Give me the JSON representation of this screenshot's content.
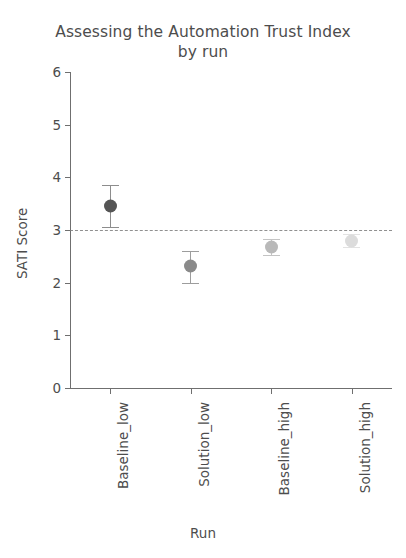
{
  "chart_data": {
    "type": "scatter",
    "title": "Assessing the Automation Trust Index by run",
    "title_line1": "Assessing the Automation Trust Index",
    "title_line2": "by run",
    "xlabel": "Run",
    "ylabel": "SATI Score",
    "ylim": [
      0,
      6
    ],
    "yticks": [
      0,
      1,
      2,
      3,
      4,
      5,
      6
    ],
    "ytick_labels": [
      "0",
      "1",
      "2",
      "3",
      "4",
      "5",
      "6"
    ],
    "grid": false,
    "legend": null,
    "categories": [
      "Baseline_low",
      "Solution_low",
      "Baseline_high",
      "Solution_high"
    ],
    "values": [
      3.45,
      2.31,
      2.67,
      2.8
    ],
    "err_low": [
      3.05,
      2.0,
      2.52,
      2.68
    ],
    "err_high": [
      3.85,
      2.61,
      2.83,
      2.92
    ],
    "point_colors": [
      "#555555",
      "#8a8a8a",
      "#b9b9b9",
      "#dcdcdc"
    ],
    "errorbar_colors": [
      "#8d8d8d",
      "#9d9d9d",
      "#c4c4c4",
      "#e2e2e2"
    ],
    "reference_line": {
      "value": 3,
      "style": "dashdot",
      "color": "#7d7d7d",
      "label": ""
    },
    "points": [
      {
        "category": "Baseline_low",
        "value": 3.45,
        "low": 3.05,
        "high": 3.85,
        "color": "#555555",
        "err_color": "#8d8d8d"
      },
      {
        "category": "Solution_low",
        "value": 2.31,
        "low": 2.0,
        "high": 2.61,
        "color": "#8a8a8a",
        "err_color": "#9d9d9d"
      },
      {
        "category": "Baseline_high",
        "value": 2.67,
        "low": 2.52,
        "high": 2.83,
        "color": "#b9b9b9",
        "err_color": "#c4c4c4"
      },
      {
        "category": "Solution_high",
        "value": 2.8,
        "low": 2.68,
        "high": 2.92,
        "color": "#dcdcdc",
        "err_color": "#e2e2e2"
      }
    ]
  },
  "colors": {
    "axis": "#6f6f6f",
    "text": "#4d4d4d",
    "background": "#ffffff"
  }
}
